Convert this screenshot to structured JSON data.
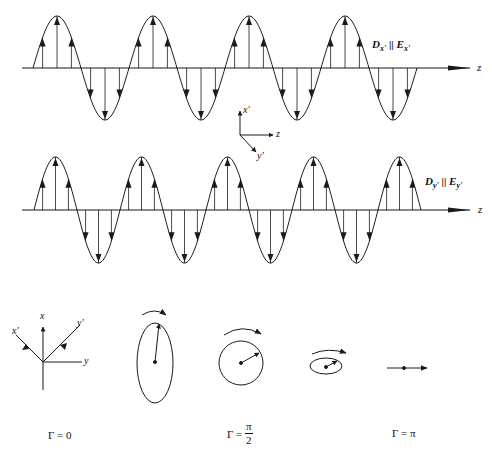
{
  "figure": {
    "type": "wave polarization diagram",
    "colors": {
      "ink": "#1a1a1a",
      "background": "#ffffff"
    }
  },
  "top_wave": {
    "component_label": {
      "D": "D",
      "D_sub": "x'",
      "parallel": "||",
      "E": "E",
      "E_sub": "x'"
    },
    "axis_label": "z",
    "axis_y": 68,
    "start_x": 33,
    "end_x": 419,
    "period": 96,
    "amplitude": 52,
    "half_cycles": 8
  },
  "bottom_wave": {
    "component_label": {
      "D": "D",
      "D_sub": "y'",
      "parallel": "||",
      "E": "E",
      "E_sub": "y'"
    },
    "axis_label": "z",
    "axis_y": 210,
    "start_x": 34,
    "end_x": 420,
    "period": 86,
    "amplitude": 53,
    "half_cycles": 9
  },
  "coordinate_triad": {
    "x_label": "x'",
    "y_label": "y'",
    "z_label": "z"
  },
  "lab_axes": {
    "x": "x",
    "y": "y",
    "x_prime": "x'",
    "y_prime": "y'"
  },
  "polarization_states": [
    {
      "shape": "vertical-ellipse",
      "label": ""
    },
    {
      "shape": "circle",
      "label_prefix": "Γ =",
      "label_num": "π",
      "label_den": "2"
    },
    {
      "shape": "horizontal-ellipse",
      "label": ""
    },
    {
      "shape": "line",
      "label": "Γ = π"
    }
  ],
  "gamma_labels": {
    "zero": "Γ = 0",
    "half_pi_prefix": "Γ =",
    "half_pi_num": "π",
    "half_pi_den": "2",
    "pi": "Γ = π"
  }
}
